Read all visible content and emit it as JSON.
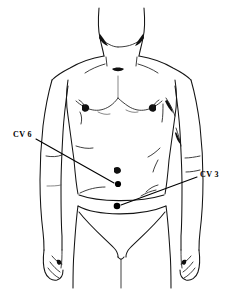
{
  "figure": {
    "background_color": "#ffffff",
    "line_color": "#141414",
    "point_color": "#000000"
  },
  "labels": [
    {
      "id": "cv6",
      "text": "CV 6",
      "anatomical_name": "Conception Vessel 6",
      "location_description": "below the umbilicus",
      "label_x": 13,
      "label_y": 131,
      "leader_from_x": 36,
      "leader_from_y": 139,
      "leader_to_x": 114,
      "leader_to_y": 183,
      "point_x": 118,
      "point_y": 184,
      "point_radius": 3.1
    },
    {
      "id": "cv3",
      "text": "CV 3",
      "anatomical_name": "Conception Vessel 3",
      "location_description": "lower abdomen above the pubic bone",
      "label_x": 200,
      "label_y": 171,
      "leader_from_x": 197,
      "leader_from_y": 177,
      "leader_to_x": 121,
      "leader_to_y": 205,
      "point_x": 117,
      "point_y": 206,
      "point_radius": 3.3
    }
  ],
  "anatomy_marks": [
    {
      "name": "umbilicus",
      "x": 117,
      "y": 171
    },
    {
      "name": "left-nipple",
      "x": 86,
      "y": 109
    },
    {
      "name": "right-nipple",
      "x": 152,
      "y": 108
    },
    {
      "name": "sternal-notch",
      "x": 118,
      "y": 70
    }
  ]
}
